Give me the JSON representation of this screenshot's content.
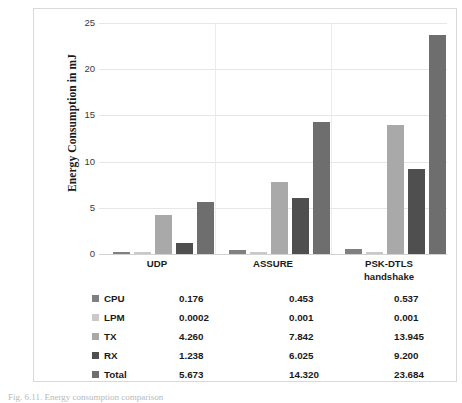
{
  "chart_data": {
    "type": "bar",
    "title": "",
    "xlabel": "",
    "ylabel": "Energy Consumption in mJ",
    "ylim": [
      0,
      25
    ],
    "yticks": [
      0,
      5,
      10,
      15,
      20,
      25
    ],
    "grid": true,
    "legend_position": "bottom-table",
    "categories": [
      "UDP",
      "ASSURE",
      "PSK-DTLS handshake"
    ],
    "category_lines": [
      [
        "UDP"
      ],
      [
        "ASSURE"
      ],
      [
        "PSK-DTLS",
        "handshake"
      ]
    ],
    "series": [
      {
        "name": "CPU",
        "color": "#808080",
        "values": [
          0.176,
          0.453,
          0.537
        ],
        "labels": [
          "0.176",
          "0.453",
          "0.537"
        ]
      },
      {
        "name": "LPM",
        "color": "#c9c9c9",
        "values": [
          0.0002,
          0.001,
          0.001
        ],
        "labels": [
          "0.0002",
          "0.001",
          "0.001"
        ]
      },
      {
        "name": "TX",
        "color": "#a9a9a9",
        "values": [
          4.26,
          7.842,
          13.945
        ],
        "labels": [
          "4.260",
          "7.842",
          "13.945"
        ]
      },
      {
        "name": "RX",
        "color": "#4f4f4f",
        "values": [
          1.238,
          6.025,
          9.2
        ],
        "labels": [
          "1.238",
          "6.025",
          "9.200"
        ]
      },
      {
        "name": "Total",
        "color": "#6e6e6e",
        "values": [
          5.673,
          14.32,
          23.684
        ],
        "labels": [
          "5.673",
          "14.320",
          "23.684"
        ]
      }
    ]
  },
  "axis": {
    "y_title": "Energy Consumption in mJ",
    "ticks": [
      "25",
      "20",
      "15",
      "10",
      "5",
      "0"
    ]
  },
  "xaxis": {
    "labels": [
      {
        "line1": "UDP",
        "line2": ""
      },
      {
        "line1": "ASSURE",
        "line2": ""
      },
      {
        "line1": "PSK-DTLS",
        "line2": "handshake"
      }
    ]
  },
  "table": {
    "rows": [
      {
        "legend": "CPU",
        "swatch": "#808080",
        "values": [
          "0.176",
          "0.453",
          "0.537"
        ]
      },
      {
        "legend": "LPM",
        "swatch": "#c9c9c9",
        "values": [
          "0.0002",
          "0.001",
          "0.001"
        ]
      },
      {
        "legend": "TX",
        "swatch": "#a9a9a9",
        "values": [
          "4.260",
          "7.842",
          "13.945"
        ]
      },
      {
        "legend": "RX",
        "swatch": "#4f4f4f",
        "values": [
          "1.238",
          "6.025",
          "9.200"
        ]
      },
      {
        "legend": "Total",
        "swatch": "#6e6e6e",
        "values": [
          "5.673",
          "14.320",
          "23.684"
        ]
      }
    ]
  },
  "caption": {
    "text": "Fig. 6.11. Energy consumption comparison"
  }
}
